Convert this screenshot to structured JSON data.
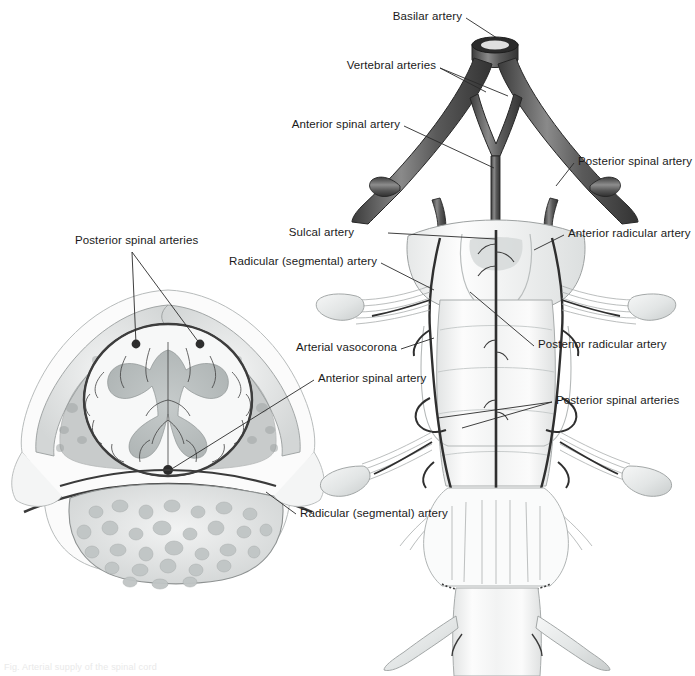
{
  "figure": {
    "title": "Arterial supply of the spinal cord",
    "caption_faint": "Fig. Arterial supply of the spinal cord",
    "views": [
      {
        "id": "cross-section",
        "name": "Transverse section through vertebra and spinal cord"
      },
      {
        "id": "anterior-view",
        "name": "Anterior view of cervical spinal cord, brainstem arteries"
      }
    ]
  },
  "colors": {
    "artery_dark": "#4c4c4c",
    "artery_mid": "#6e6e6e",
    "artery_light": "#9a9a9a",
    "gray_matter": "#bfc4c4",
    "white_matter": "#f4f5f5",
    "bone_fill": "#dcdedd",
    "bone_stroke": "#8d9190",
    "label_text": "#1a1a1a",
    "leader_line": "#2a2a2a",
    "cord_fill": "#fbfbfb",
    "cord_shade": "#e4e6e6",
    "background": "#ffffff"
  },
  "labels": [
    {
      "id": "basilar-artery",
      "text": "Basilar artery",
      "x": 462,
      "y": 16,
      "align": "right"
    },
    {
      "id": "vertebral-arteries",
      "text": "Vertebral arteries",
      "x": 436,
      "y": 65,
      "align": "right"
    },
    {
      "id": "anterior-spinal-artery-top",
      "text": "Anterior spinal artery",
      "x": 400,
      "y": 124,
      "align": "right"
    },
    {
      "id": "posterior-spinal-artery",
      "text": "Posterior spinal artery",
      "x": 578,
      "y": 161,
      "align": "left"
    },
    {
      "id": "sulcal-artery",
      "text": "Sulcal artery",
      "x": 354,
      "y": 232,
      "align": "right"
    },
    {
      "id": "anterior-radicular-artery",
      "text": "Anterior radicular artery",
      "x": 568,
      "y": 233,
      "align": "left"
    },
    {
      "id": "radicular-segmental-artery-top",
      "text": "Radicular (segmental) artery",
      "x": 377,
      "y": 261,
      "align": "right"
    },
    {
      "id": "arterial-vasocorona",
      "text": "Arterial vasocorona",
      "x": 397,
      "y": 347,
      "align": "right"
    },
    {
      "id": "posterior-radicular-artery",
      "text": "Posterior radicular artery",
      "x": 538,
      "y": 344,
      "align": "left"
    },
    {
      "id": "posterior-spinal-arteries-right",
      "text": "Posterior spinal arteries",
      "x": 556,
      "y": 400,
      "align": "left"
    },
    {
      "id": "posterior-spinal-arteries-left",
      "text": "Posterior spinal arteries",
      "x": 75,
      "y": 240,
      "align": "left"
    },
    {
      "id": "anterior-spinal-artery-left",
      "text": "Anterior spinal artery",
      "x": 318,
      "y": 378,
      "align": "left"
    },
    {
      "id": "radicular-segmental-artery-bottom",
      "text": "Radicular (segmental) artery",
      "x": 300,
      "y": 513,
      "align": "left"
    }
  ],
  "structures": {
    "cross_section": [
      "vertebral body",
      "cancellous bone",
      "spinal cord",
      "gray matter",
      "white matter",
      "dura mater",
      "posterior spinal arteries",
      "anterior spinal artery",
      "radicular (segmental) artery",
      "arterial vasocorona"
    ],
    "anterior_view": [
      "basilar artery",
      "vertebral arteries",
      "anterior spinal artery",
      "posterior spinal artery",
      "sulcal artery",
      "anterior radicular artery",
      "posterior radicular artery",
      "spinal nerve roots",
      "dorsal root ganglion",
      "cervical spinal cord",
      "cervical enlargement"
    ]
  }
}
